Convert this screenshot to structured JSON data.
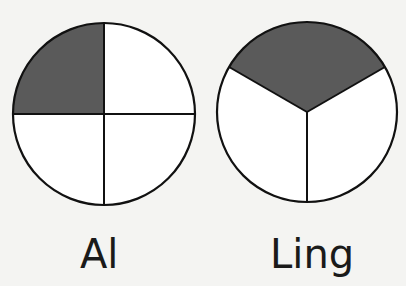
{
  "figure": {
    "colors": {
      "background": "#f4f4f2",
      "shaded": "#5a5a5a",
      "unshaded": "#ffffff",
      "stroke": "#111111"
    },
    "circles": [
      {
        "label": "Al",
        "parts": 4,
        "shaded_parts": 1,
        "fraction": "1/4",
        "shaded_region": "top-left quarter"
      },
      {
        "label": "Ling",
        "parts": 3,
        "shaded_parts": 1,
        "fraction": "1/3",
        "shaded_region": "top third"
      }
    ]
  }
}
